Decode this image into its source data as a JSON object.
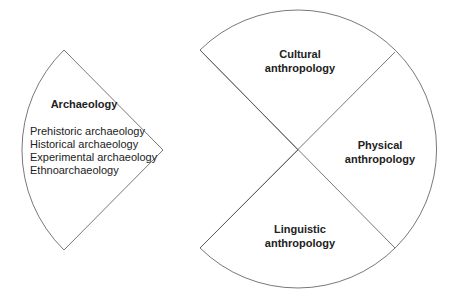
{
  "archaeology": {
    "title": "Archaeology",
    "items": [
      "Prehistoric archaeology",
      "Historical archaeology",
      "Experimental archaeology",
      "Ethnoarchaeology"
    ]
  },
  "anthropology": {
    "cultural": [
      "Cultural",
      "anthropology"
    ],
    "physical": [
      "Physical",
      "anthropology"
    ],
    "linguistic": [
      "Linguistic",
      "anthropology"
    ]
  }
}
